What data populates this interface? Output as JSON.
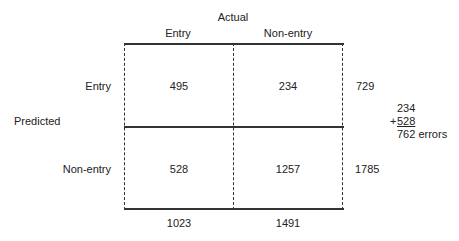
{
  "header": {
    "actual_label": "Actual"
  },
  "columns": [
    {
      "label": "Entry"
    },
    {
      "label": "Non-entry"
    }
  ],
  "rows_title": "Predicted",
  "rows": [
    {
      "label": "Entry",
      "cells": [
        "495",
        "234"
      ],
      "total": "729"
    },
    {
      "label": "Non-entry",
      "cells": [
        "528",
        "1257"
      ],
      "total": "1785"
    }
  ],
  "column_totals": [
    "1023",
    "1491"
  ],
  "errors": {
    "line1": "234",
    "plus": "+",
    "line2": "528",
    "total": "762 errors"
  }
}
